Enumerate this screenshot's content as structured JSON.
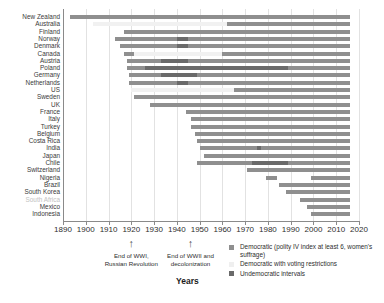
{
  "chart_data": {
    "type": "bar",
    "title": "",
    "xlabel": "Years",
    "ylabel": "",
    "xlim": [
      1890,
      2020
    ],
    "xticks": [
      1890,
      1900,
      1910,
      1920,
      1930,
      1940,
      1950,
      1960,
      1970,
      1980,
      1990,
      2000,
      2010,
      2020
    ],
    "xticklabels": [
      "1890",
      "1900",
      "1910",
      "1920",
      "1930",
      "1940",
      "1950",
      "1960",
      "1970",
      "1980",
      "1990",
      "2000",
      "2010",
      "2020"
    ],
    "grid": true,
    "legend_position": "bottom-right",
    "categories": [
      "New Zealand",
      "Australia",
      "Finland",
      "Norway",
      "Denmark",
      "Canada",
      "Austria",
      "Poland",
      "Germany",
      "Netherlands",
      "US",
      "Sweden",
      "UK",
      "France",
      "Italy",
      "Turkey",
      "Belgium",
      "Costa Rica",
      "India",
      "Japan",
      "Chile",
      "Switzerland",
      "Nigeria",
      "Brazil",
      "South Korea",
      "South Africa",
      "Mexico",
      "Indonesia"
    ],
    "series": [
      {
        "name": "Democratic (polity IV index at least 6, women's suffrage)",
        "color": "#8f8f8f",
        "key": "dem"
      },
      {
        "name": "Democratic with voting restrictions",
        "color": "#efefef",
        "key": "restr"
      },
      {
        "name": "Undemocratic intervals",
        "color": "#6a6a6a",
        "key": "undem"
      }
    ],
    "rows": [
      {
        "country": "New Zealand",
        "muted": false,
        "segments": [
          {
            "type": "dem",
            "start": 1893,
            "end": 2016
          }
        ]
      },
      {
        "country": "Australia",
        "muted": false,
        "segments": [
          {
            "type": "restr",
            "start": 1903,
            "end": 1962
          },
          {
            "type": "dem",
            "start": 1962,
            "end": 2016
          }
        ]
      },
      {
        "country": "Finland",
        "muted": false,
        "segments": [
          {
            "type": "dem",
            "start": 1917,
            "end": 2016
          }
        ]
      },
      {
        "country": "Norway",
        "muted": false,
        "segments": [
          {
            "type": "dem",
            "start": 1913,
            "end": 1940
          },
          {
            "type": "undem",
            "start": 1940,
            "end": 1945
          },
          {
            "type": "dem",
            "start": 1945,
            "end": 2016
          }
        ]
      },
      {
        "country": "Denmark",
        "muted": false,
        "segments": [
          {
            "type": "dem",
            "start": 1915,
            "end": 1940
          },
          {
            "type": "undem",
            "start": 1940,
            "end": 1945
          },
          {
            "type": "dem",
            "start": 1945,
            "end": 2016
          }
        ]
      },
      {
        "country": "Canada",
        "muted": false,
        "segments": [
          {
            "type": "dem",
            "start": 1917,
            "end": 1921
          },
          {
            "type": "restr",
            "start": 1921,
            "end": 1960
          },
          {
            "type": "dem",
            "start": 1960,
            "end": 2016
          }
        ]
      },
      {
        "country": "Austria",
        "muted": false,
        "segments": [
          {
            "type": "dem",
            "start": 1918,
            "end": 1933
          },
          {
            "type": "undem",
            "start": 1933,
            "end": 1945
          },
          {
            "type": "dem",
            "start": 1945,
            "end": 2016
          }
        ]
      },
      {
        "country": "Poland",
        "muted": false,
        "segments": [
          {
            "type": "dem",
            "start": 1918,
            "end": 1926
          },
          {
            "type": "undem",
            "start": 1926,
            "end": 1989
          },
          {
            "type": "dem",
            "start": 1989,
            "end": 2016
          }
        ]
      },
      {
        "country": "Germany",
        "muted": false,
        "segments": [
          {
            "type": "dem",
            "start": 1919,
            "end": 1933
          },
          {
            "type": "undem",
            "start": 1933,
            "end": 1949
          },
          {
            "type": "dem",
            "start": 1949,
            "end": 2016
          }
        ]
      },
      {
        "country": "Netherlands",
        "muted": false,
        "segments": [
          {
            "type": "dem",
            "start": 1919,
            "end": 1940
          },
          {
            "type": "undem",
            "start": 1940,
            "end": 1945
          },
          {
            "type": "dem",
            "start": 1945,
            "end": 2016
          }
        ]
      },
      {
        "country": "US",
        "muted": false,
        "segments": [
          {
            "type": "restr",
            "start": 1920,
            "end": 1965
          },
          {
            "type": "dem",
            "start": 1965,
            "end": 2016
          }
        ]
      },
      {
        "country": "Sweden",
        "muted": false,
        "segments": [
          {
            "type": "dem",
            "start": 1921,
            "end": 2016
          }
        ]
      },
      {
        "country": "UK",
        "muted": false,
        "segments": [
          {
            "type": "dem",
            "start": 1928,
            "end": 2016
          }
        ]
      },
      {
        "country": "France",
        "muted": false,
        "segments": [
          {
            "type": "dem",
            "start": 1944,
            "end": 1958
          },
          {
            "type": "dem",
            "start": 1958,
            "end": 2016
          }
        ]
      },
      {
        "country": "Italy",
        "muted": false,
        "segments": [
          {
            "type": "dem",
            "start": 1946,
            "end": 2016
          }
        ]
      },
      {
        "country": "Turkey",
        "muted": false,
        "segments": [
          {
            "type": "dem",
            "start": 1946,
            "end": 2016
          }
        ]
      },
      {
        "country": "Belgium",
        "muted": false,
        "segments": [
          {
            "type": "dem",
            "start": 1948,
            "end": 2016
          }
        ]
      },
      {
        "country": "Costa Rica",
        "muted": false,
        "segments": [
          {
            "type": "dem",
            "start": 1949,
            "end": 2016
          }
        ]
      },
      {
        "country": "India",
        "muted": false,
        "segments": [
          {
            "type": "dem",
            "start": 1950,
            "end": 1975
          },
          {
            "type": "undem",
            "start": 1975,
            "end": 1977
          },
          {
            "type": "dem",
            "start": 1977,
            "end": 2016
          }
        ]
      },
      {
        "country": "Japan",
        "muted": false,
        "segments": [
          {
            "type": "dem",
            "start": 1952,
            "end": 2016
          }
        ]
      },
      {
        "country": "Chile",
        "muted": false,
        "segments": [
          {
            "type": "dem",
            "start": 1949,
            "end": 1973
          },
          {
            "type": "undem",
            "start": 1973,
            "end": 1989
          },
          {
            "type": "dem",
            "start": 1989,
            "end": 2016
          }
        ]
      },
      {
        "country": "Switzerland",
        "muted": false,
        "segments": [
          {
            "type": "dem",
            "start": 1971,
            "end": 2016
          }
        ]
      },
      {
        "country": "Nigeria",
        "muted": false,
        "segments": [
          {
            "type": "dem",
            "start": 1979,
            "end": 1984
          },
          {
            "type": "dem",
            "start": 1999,
            "end": 2016
          }
        ]
      },
      {
        "country": "Brazil",
        "muted": false,
        "segments": [
          {
            "type": "dem",
            "start": 1985,
            "end": 2016
          }
        ]
      },
      {
        "country": "South Korea",
        "muted": false,
        "segments": [
          {
            "type": "dem",
            "start": 1988,
            "end": 2016
          }
        ]
      },
      {
        "country": "South Africa",
        "muted": true,
        "segments": [
          {
            "type": "dem",
            "start": 1994,
            "end": 2016
          }
        ]
      },
      {
        "country": "Mexico",
        "muted": false,
        "segments": [
          {
            "type": "dem",
            "start": 1997,
            "end": 2016
          }
        ]
      },
      {
        "country": "Indonesia",
        "muted": false,
        "segments": [
          {
            "type": "dem",
            "start": 1999,
            "end": 2016
          }
        ]
      }
    ],
    "annotations": [
      {
        "year": 1920,
        "lines": [
          "End of WWI,",
          "Russian Revolution"
        ]
      },
      {
        "year": 1946,
        "lines": [
          "End of WWII and",
          "decolonization"
        ]
      }
    ]
  }
}
